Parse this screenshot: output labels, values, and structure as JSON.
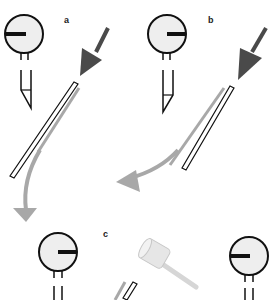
{
  "figure": {
    "panels": [
      {
        "label": "a",
        "description": "gauge with pointer left, plunger retracted, arrow pushes needle in"
      },
      {
        "label": "b",
        "description": "gauge with pointer right, needle withdrawn along curved arrow"
      },
      {
        "label": "c",
        "description": "gauges with pointer left, hammer striking needle"
      }
    ]
  },
  "colors": {
    "stroke": "#111111",
    "gauge_fill": "#eeeeee",
    "dark_arrow": "#4a4a4a",
    "light_arrow": "#a8a8a8",
    "hammer": "#dddddd"
  }
}
